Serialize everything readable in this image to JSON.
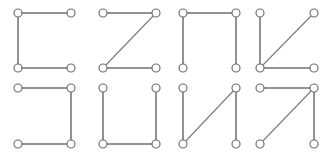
{
  "diagram": {
    "title": "",
    "node_radius": 4,
    "colors": {
      "stroke": "#6f6f6f",
      "node_fill": "#ffffff",
      "background": "#ffffff"
    },
    "shapes": [
      {
        "id": "shape-1",
        "glyph": "C-shape",
        "nodes": {
          "tl": [
            18,
            13
          ],
          "tr": [
            71,
            13
          ],
          "bl": [
            18,
            68
          ],
          "br": [
            71,
            68
          ]
        },
        "edges": [
          [
            "tr",
            "tl"
          ],
          [
            "tl",
            "bl"
          ],
          [
            "bl",
            "br"
          ]
        ]
      },
      {
        "id": "shape-2",
        "glyph": "Z-shape",
        "nodes": {
          "tl": [
            103,
            13
          ],
          "tr": [
            156,
            13
          ],
          "bl": [
            103,
            68
          ],
          "br": [
            156,
            68
          ]
        },
        "edges": [
          [
            "tl",
            "tr"
          ],
          [
            "tr",
            "bl"
          ],
          [
            "bl",
            "br"
          ]
        ]
      },
      {
        "id": "shape-3",
        "glyph": "arch-shape",
        "nodes": {
          "tl": [
            183,
            13
          ],
          "tr": [
            236,
            13
          ],
          "bl": [
            183,
            68
          ],
          "br": [
            236,
            68
          ]
        },
        "edges": [
          [
            "bl",
            "tl"
          ],
          [
            "tl",
            "tr"
          ],
          [
            "tr",
            "br"
          ]
        ]
      },
      {
        "id": "shape-4",
        "glyph": "K-shape",
        "nodes": {
          "tl": [
            260,
            13
          ],
          "tr": [
            314,
            13
          ],
          "bl": [
            260,
            68
          ],
          "br": [
            314,
            68
          ]
        },
        "edges": [
          [
            "tl",
            "bl"
          ],
          [
            "bl",
            "tr"
          ],
          [
            "bl",
            "br"
          ]
        ]
      },
      {
        "id": "shape-5",
        "glyph": "reverse-C-shape",
        "nodes": {
          "tl": [
            18,
            88
          ],
          "tr": [
            71,
            88
          ],
          "bl": [
            18,
            144
          ],
          "br": [
            71,
            144
          ]
        },
        "edges": [
          [
            "tl",
            "tr"
          ],
          [
            "tr",
            "br"
          ],
          [
            "br",
            "bl"
          ]
        ]
      },
      {
        "id": "shape-6",
        "glyph": "U-shape",
        "nodes": {
          "tl": [
            103,
            88
          ],
          "tr": [
            156,
            88
          ],
          "bl": [
            103,
            144
          ],
          "br": [
            156,
            144
          ]
        },
        "edges": [
          [
            "tl",
            "bl"
          ],
          [
            "bl",
            "br"
          ],
          [
            "br",
            "tr"
          ]
        ]
      },
      {
        "id": "shape-7",
        "glyph": "N-shape",
        "nodes": {
          "tl": [
            183,
            88
          ],
          "tr": [
            236,
            88
          ],
          "bl": [
            183,
            144
          ],
          "br": [
            236,
            144
          ]
        },
        "edges": [
          [
            "tl",
            "bl"
          ],
          [
            "bl",
            "tr"
          ],
          [
            "tr",
            "br"
          ]
        ]
      },
      {
        "id": "shape-8",
        "glyph": "7-shape",
        "nodes": {
          "tl": [
            260,
            88
          ],
          "tr": [
            314,
            88
          ],
          "bl": [
            260,
            144
          ],
          "br": [
            314,
            144
          ]
        },
        "edges": [
          [
            "tl",
            "tr"
          ],
          [
            "tr",
            "bl"
          ],
          [
            "tr",
            "br"
          ]
        ]
      }
    ]
  }
}
